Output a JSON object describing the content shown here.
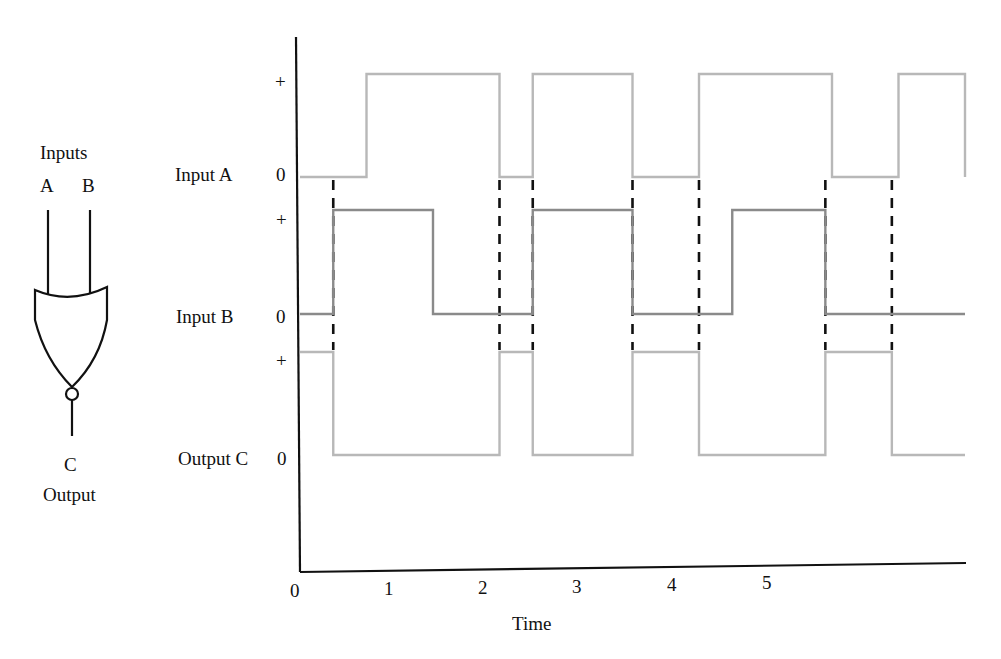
{
  "gate": {
    "title": "Inputs",
    "input_a": "A",
    "input_b": "B",
    "output_letter": "C",
    "output_label": "Output",
    "type": "NOR"
  },
  "chart_data": {
    "type": "line",
    "subtype": "digital timing diagram (step)",
    "title": "",
    "xlabel": "Time",
    "ylabel": "",
    "xlim": [
      0,
      5
    ],
    "x_ticks": [
      "0",
      "1",
      "2",
      "3",
      "4",
      "5"
    ],
    "grid": false,
    "level_labels": {
      "high": "+",
      "low": "0"
    },
    "series": [
      {
        "name": "Input A",
        "color": "#b8b8b8",
        "transitions": [
          [
            0,
            0
          ],
          [
            0.5,
            1
          ],
          [
            1.5,
            0
          ],
          [
            1.75,
            1
          ],
          [
            2.5,
            0
          ],
          [
            3.0,
            1
          ],
          [
            4.0,
            0
          ],
          [
            4.5,
            1
          ],
          [
            5.0,
            0
          ]
        ]
      },
      {
        "name": "Input B",
        "color": "#8a8a8a",
        "transitions": [
          [
            0,
            0
          ],
          [
            0.25,
            1
          ],
          [
            1.0,
            0
          ],
          [
            1.75,
            1
          ],
          [
            2.5,
            0
          ],
          [
            3.25,
            1
          ],
          [
            3.95,
            0
          ],
          [
            5.0,
            0
          ]
        ]
      },
      {
        "name": "Output C",
        "color": "#b8b8b8",
        "transitions": [
          [
            0,
            1
          ],
          [
            0.25,
            0
          ],
          [
            1.5,
            1
          ],
          [
            1.75,
            0
          ],
          [
            2.5,
            1
          ],
          [
            3.0,
            0
          ],
          [
            3.95,
            1
          ],
          [
            4.45,
            0
          ],
          [
            5.0,
            0
          ]
        ]
      }
    ],
    "dashed_markers_x": [
      0.25,
      1.5,
      1.75,
      2.5,
      3.0,
      3.95,
      4.45
    ]
  },
  "labels": {
    "input_a": "Input A",
    "input_b": "Input B",
    "output_c": "Output C",
    "plus": "+",
    "zero": "0"
  }
}
